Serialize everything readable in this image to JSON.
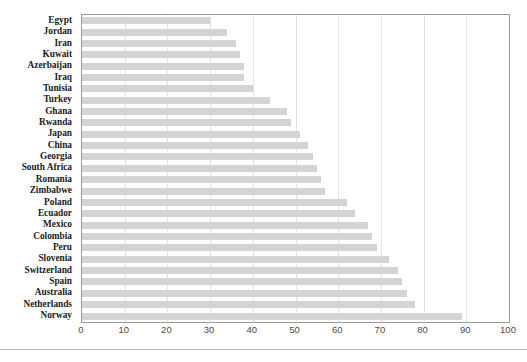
{
  "chart_data": {
    "type": "bar",
    "orientation": "horizontal",
    "title": "",
    "xlabel": "",
    "ylabel": "",
    "xlim": [
      0,
      100
    ],
    "xticks": [
      0,
      10,
      20,
      30,
      40,
      50,
      60,
      70,
      80,
      90,
      100
    ],
    "grid": true,
    "legend": false,
    "bar_color": "#d4d4d4",
    "plot_border_color": "#9a9a9a",
    "gridline_color": "#e2e2e2",
    "categories": [
      "Egypt",
      "Jordan",
      "Iran",
      "Kuwait",
      "Azerbaijan",
      "Iraq",
      "Tunisia",
      "Turkey",
      "Ghana",
      "Rwanda",
      "Japan",
      "China",
      "Georgia",
      "South Africa",
      "Romania",
      "Zimbabwe",
      "Poland",
      "Ecuador",
      "Mexico",
      "Colombia",
      "Peru",
      "Slovenia",
      "Switzerland",
      "Spain",
      "Australia",
      "Netherlands",
      "Norway"
    ],
    "values": [
      30,
      34,
      36,
      37,
      38,
      38,
      40,
      44,
      48,
      49,
      51,
      53,
      54,
      55,
      56,
      57,
      62,
      64,
      67,
      68,
      69,
      72,
      74,
      75,
      76,
      78,
      89
    ]
  }
}
